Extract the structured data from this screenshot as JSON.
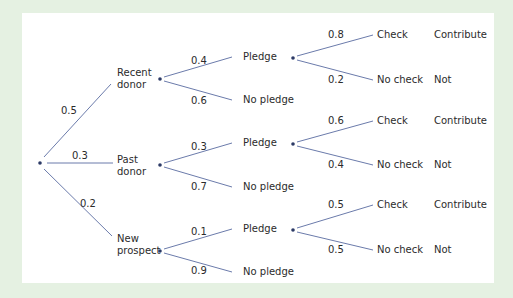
{
  "colors": {
    "background": "#e5f1e2",
    "panel": "#ffffff",
    "line": "#6b7bab",
    "node": "#2c3a66",
    "text": "#2b2b2b"
  },
  "tree": {
    "root": {
      "label": ""
    },
    "level1": [
      {
        "label_line1": "Recent",
        "label_line2": "donor",
        "prob": "0.5"
      },
      {
        "label_line1": "Past",
        "label_line2": "donor",
        "prob": "0.3"
      },
      {
        "label_line1": "New",
        "label_line2": "prospect",
        "prob": "0.2"
      }
    ],
    "level2": [
      {
        "pledge": "Pledge",
        "pledge_prob": "0.4",
        "no_pledge": "No pledge",
        "no_pledge_prob": "0.6"
      },
      {
        "pledge": "Pledge",
        "pledge_prob": "0.3",
        "no_pledge": "No pledge",
        "no_pledge_prob": "0.7"
      },
      {
        "pledge": "Pledge",
        "pledge_prob": "0.1",
        "no_pledge": "No pledge",
        "no_pledge_prob": "0.9"
      }
    ],
    "level3": [
      {
        "check": "Check",
        "check_prob": "0.8",
        "no_check": "No check",
        "no_check_prob": "0.2",
        "check_outcome": "Contribute",
        "no_check_outcome": "Not"
      },
      {
        "check": "Check",
        "check_prob": "0.6",
        "no_check": "No check",
        "no_check_prob": "0.4",
        "check_outcome": "Contribute",
        "no_check_outcome": "Not"
      },
      {
        "check": "Check",
        "check_prob": "0.5",
        "no_check": "No check",
        "no_check_prob": "0.5",
        "check_outcome": "Contribute",
        "no_check_outcome": "Not"
      }
    ]
  }
}
